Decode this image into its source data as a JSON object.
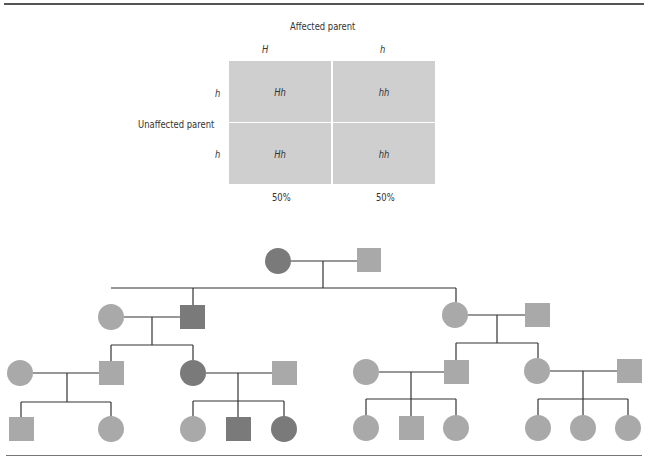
{
  "punnett": {
    "top_label": "Affected parent",
    "side_label": "Unaffected parent",
    "col_alleles": [
      "H",
      "h"
    ],
    "row_alleles": [
      "h",
      "h"
    ],
    "cells": [
      [
        "Hh",
        "hh"
      ],
      [
        "Hh",
        "hh"
      ]
    ],
    "percentages": [
      "50%",
      "50%"
    ],
    "cell_color": "#cfcfcf"
  },
  "pedigree": {
    "colors": {
      "affected": "#7a7a7a",
      "unaffected": "#a9a9a9",
      "line": "#333333"
    },
    "generations": [
      {
        "gen": "I",
        "members": [
          {
            "sex": "female",
            "affected": true
          },
          {
            "sex": "male",
            "affected": false
          }
        ]
      },
      {
        "gen": "II",
        "members": [
          {
            "sex": "female",
            "affected": false
          },
          {
            "sex": "male",
            "affected": true
          },
          {
            "sex": "female",
            "affected": false
          },
          {
            "sex": "male",
            "affected": false
          }
        ]
      },
      {
        "gen": "III",
        "members": [
          {
            "sex": "female",
            "affected": false
          },
          {
            "sex": "male",
            "affected": false
          },
          {
            "sex": "female",
            "affected": true
          },
          {
            "sex": "male",
            "affected": false
          },
          {
            "sex": "female",
            "affected": false
          },
          {
            "sex": "male",
            "affected": false
          },
          {
            "sex": "female",
            "affected": false
          },
          {
            "sex": "male",
            "affected": false
          }
        ]
      },
      {
        "gen": "IV",
        "members": [
          {
            "sex": "male",
            "affected": false
          },
          {
            "sex": "female",
            "affected": false
          },
          {
            "sex": "female",
            "affected": false
          },
          {
            "sex": "male",
            "affected": true
          },
          {
            "sex": "female",
            "affected": true
          },
          {
            "sex": "female",
            "affected": false
          },
          {
            "sex": "male",
            "affected": false
          },
          {
            "sex": "female",
            "affected": false
          },
          {
            "sex": "female",
            "affected": false
          },
          {
            "sex": "female",
            "affected": false
          },
          {
            "sex": "female",
            "affected": false
          }
        ]
      }
    ]
  }
}
